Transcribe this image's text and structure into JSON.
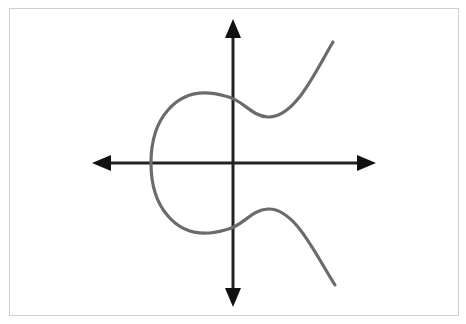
{
  "diagram": {
    "title": "",
    "type": "elliptic curve on Cartesian axes",
    "colors": {
      "background": "#ffffff",
      "frame_border": "#cfcfcf",
      "axes": "#222222",
      "curve": "#6b6b6b"
    },
    "axes": {
      "x_axis": {
        "label": "",
        "arrows": [
          "left",
          "right"
        ]
      },
      "y_axis": {
        "label": "",
        "arrows": [
          "up",
          "down"
        ]
      }
    },
    "curve": {
      "description": "Elliptic curve y^2 = x^3 - ax + b shape, single connected component, symmetric about x-axis",
      "labels": []
    }
  }
}
